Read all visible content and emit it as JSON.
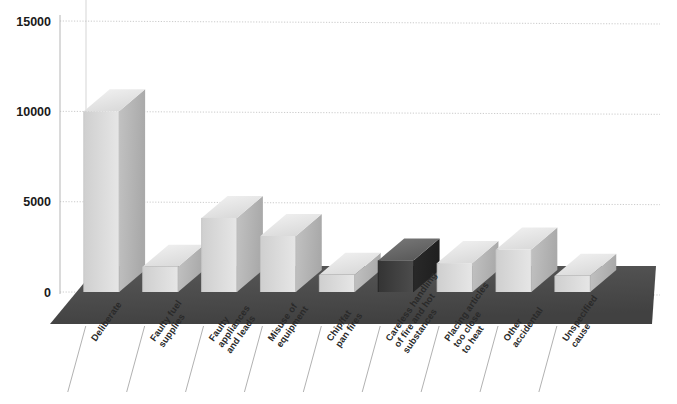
{
  "chart_data": {
    "type": "bar",
    "title": "",
    "subtitle": "",
    "xlabel": "",
    "ylabel": "",
    "ylim": [
      0,
      15000
    ],
    "yticks": [
      0,
      5000,
      10000,
      15000
    ],
    "ytick_labels": [
      "0",
      "5000",
      "10000",
      "15000"
    ],
    "grid": true,
    "legend": "none",
    "style": "3d-bar",
    "categories": [
      "Deliberate",
      "Faulty fuel supplies",
      "Faulty appliances and leads",
      "Misuse of equipment",
      "Chip/fat pan fires",
      "Careless handling of fire and hot substances",
      "Placing articles too close to heat",
      "Other accidental",
      "Unspecified cause"
    ],
    "category_lines": [
      [
        "Deliberate"
      ],
      [
        "Faulty fuel",
        "supplies"
      ],
      [
        "Faulty",
        "appliances",
        "and leads"
      ],
      [
        "Misuse of",
        "equipment"
      ],
      [
        "Chip/fat",
        "pan fires"
      ],
      [
        "Careless handling",
        "of fire and hot",
        "substances"
      ],
      [
        "Placing articles",
        "too close",
        "to heat"
      ],
      [
        "Other",
        "accidental"
      ],
      [
        "Unspecified",
        "cause"
      ]
    ],
    "values": [
      10000,
      1400,
      4100,
      3100,
      950,
      1750,
      1600,
      2350,
      900
    ],
    "bar_shades": [
      "light",
      "light",
      "light",
      "light",
      "light",
      "dark",
      "light",
      "light",
      "light"
    ]
  },
  "colors": {
    "bar_front": "#d7d7d7",
    "bar_top": "#efefef",
    "bar_side": "#bdbdbd",
    "bar_dark_front": "#3f3f3f",
    "bar_dark_top": "#6e6e6e",
    "bar_dark_side": "#2e2e2e",
    "floor": "#4d4d4d",
    "floor_edge": "#3a3a3a",
    "grid": "#c9c9c9",
    "axis": "#b5b5b5",
    "text": "#1a1a1a",
    "leader": "#a8a8a8",
    "background": "#ffffff"
  },
  "axis": {
    "y_labels": [
      "15000",
      "10000",
      "5000",
      "0"
    ]
  }
}
